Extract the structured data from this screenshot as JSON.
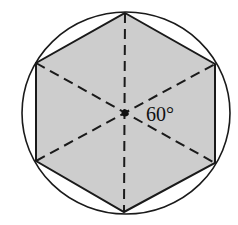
{
  "diagram": {
    "angle_label": "60°",
    "colors": {
      "hexagon_fill": "#cdcdcd",
      "stroke": "#1a1a1a",
      "background": "#ffffff"
    },
    "circle": {
      "cx": 126,
      "cy": 113,
      "rx": 104,
      "ry": 101
    },
    "hexagon_vertices": [
      [
        125,
        13
      ],
      [
        215,
        64
      ],
      [
        215,
        163
      ],
      [
        124,
        212
      ],
      [
        36,
        161
      ],
      [
        36,
        63
      ]
    ],
    "center": [
      125,
      113
    ]
  }
}
